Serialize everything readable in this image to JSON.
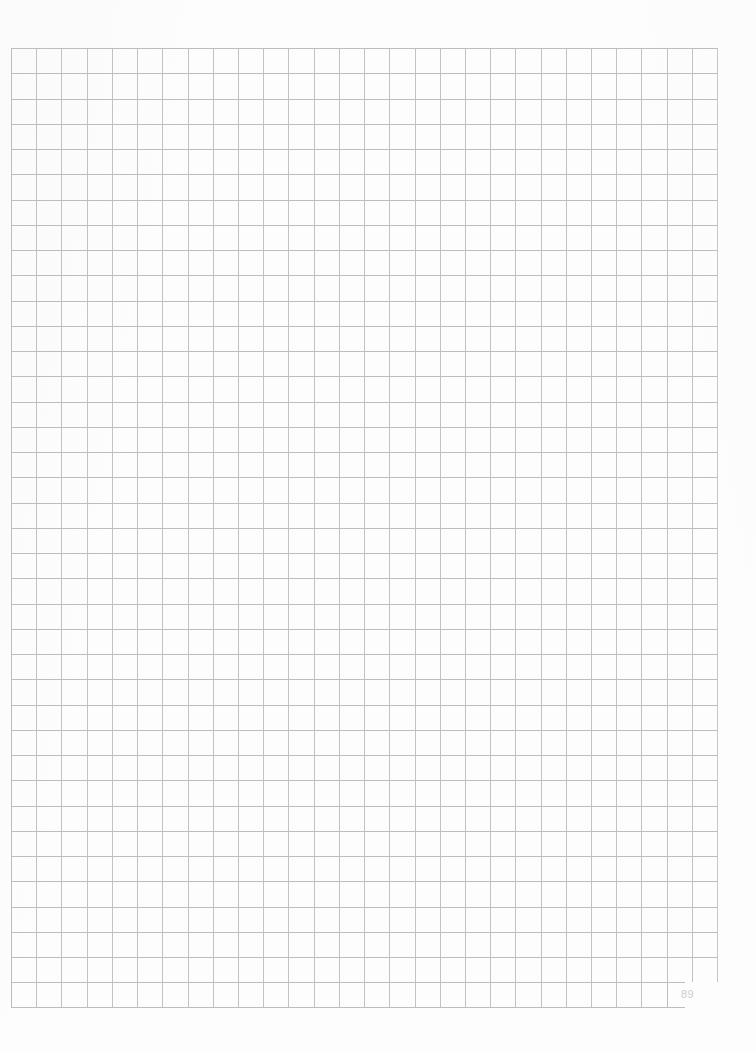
{
  "document": {
    "kind": "graph-paper-page",
    "page_number": "89",
    "background_color": "#fdfdfd",
    "page_width": 756,
    "page_height": 1051
  },
  "grid": {
    "name": "square-ruled-grid",
    "columns": 28,
    "rows": 38,
    "cell_width_px": 25.22,
    "cell_height_px": 25.26,
    "left_px": 11,
    "top_px": 48,
    "width_px": 707,
    "height_px": 960,
    "line_color": "#bdbdbd",
    "minor_line_color": "#c2c2c2",
    "last_row_columns": 26,
    "content": ""
  },
  "annotations": {
    "handwriting": "",
    "notes": ""
  }
}
